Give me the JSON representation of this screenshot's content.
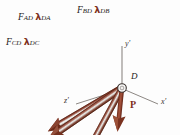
{
  "figure": {
    "background_color": "#fdfdfd",
    "arrow_color": "#7d2f20",
    "arrow_dark": "#5e2317",
    "arrow_highlight": "#d9d6d2",
    "axis_color": "#8d8884",
    "text_color": "#241a16",
    "joint": {
      "label": "D",
      "label_x": 132,
      "label_y": 75,
      "cx": 122,
      "cy": 88,
      "r": 4
    },
    "axes": [
      {
        "name": "y-prime",
        "label": "y'",
        "label_x": 126,
        "label_y": 44,
        "x1": 122,
        "y1": 88,
        "x2": 122,
        "y2": 46
      },
      {
        "name": "x-prime",
        "label": "x'",
        "label_x": 162,
        "label_y": 101,
        "x1": 122,
        "y1": 88,
        "x2": 158,
        "y2": 104
      },
      {
        "name": "z-prime",
        "label": "z'",
        "label_x": 66,
        "label_y": 100,
        "x1": 122,
        "y1": 88,
        "x2": 74,
        "y2": 104
      }
    ],
    "forces": [
      {
        "name": "force-AD",
        "magnitude": "F",
        "magnitude_sub": "AD",
        "unit_vector": "λ",
        "unit_vector_sub": "DA",
        "label_x": 18,
        "label_y": 14,
        "x1": 122,
        "y1": 88,
        "x2": 38,
        "y2": 30,
        "width": 7
      },
      {
        "name": "force-BD",
        "magnitude": "F",
        "magnitude_sub": "BD",
        "unit_vector": "λ",
        "unit_vector_sub": "DB",
        "label_x": 78,
        "label_y": 8,
        "x1": 122,
        "y1": 88,
        "x2": 88,
        "y2": 25,
        "width": 6
      },
      {
        "name": "force-CD",
        "magnitude": "F",
        "magnitude_sub": "CD",
        "unit_vector": "λ",
        "unit_vector_sub": "DC",
        "label_x": 8,
        "label_y": 39,
        "x1": 122,
        "y1": 88,
        "x2": 42,
        "y2": 41,
        "width": 7
      }
    ],
    "applied_load": {
      "name": "load-P",
      "label": "P",
      "label_x": 131,
      "label_y": 104,
      "x1": 122,
      "y1": 88,
      "x2": 118,
      "y2": 128,
      "width": 4
    }
  }
}
